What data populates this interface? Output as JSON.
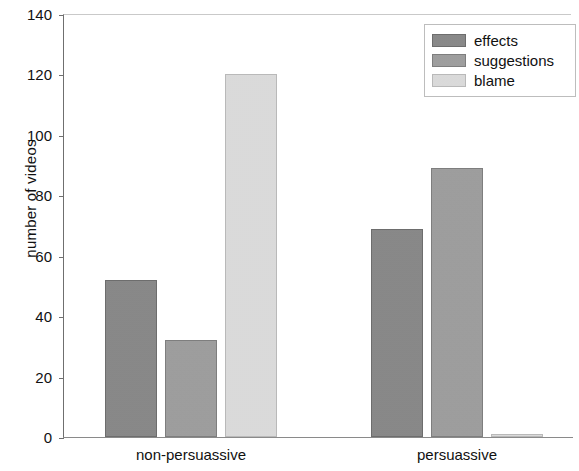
{
  "chart_data": {
    "type": "bar",
    "title": "",
    "subtitle": "",
    "xlabel": "",
    "ylabel": "number of videos",
    "categories": [
      "non-persuassive",
      "persuassive"
    ],
    "series": [
      {
        "name": "effects",
        "values": [
          52,
          69
        ],
        "color": "#878787"
      },
      {
        "name": "suggestions",
        "values": [
          32,
          89
        ],
        "color": "#9d9d9d"
      },
      {
        "name": "blame",
        "values": [
          120,
          1
        ],
        "color": "#dcdcdc"
      }
    ],
    "ylim": [
      0,
      140
    ],
    "yticks": [
      0,
      20,
      40,
      60,
      80,
      100,
      120,
      140
    ],
    "ytick_labels": [
      "0",
      "20",
      "40",
      "60",
      "80",
      "100",
      "120",
      "140"
    ],
    "grid": false,
    "legend_position": "top-right",
    "annotations": []
  },
  "legend": {
    "entries": [
      {
        "label": "effects"
      },
      {
        "label": "suggestions"
      },
      {
        "label": "blame"
      }
    ]
  },
  "axes": {
    "y_title": "number of videos"
  }
}
